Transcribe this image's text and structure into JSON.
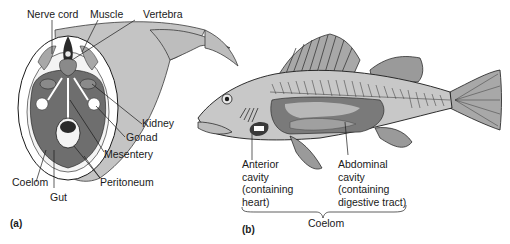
{
  "figure": {
    "panel_a": {
      "panel_label": "(a)",
      "title": "Cross-section of fish body",
      "labels": {
        "nerve_cord": "Nerve cord",
        "muscle": "Muscle",
        "vertebra": "Vertebra",
        "kidney": "Kidney",
        "gonad": "Gonad",
        "mesentery": "Mesentery",
        "peritoneum": "Peritoneum",
        "coelom": "Coelom",
        "gut": "Gut"
      }
    },
    "panel_b": {
      "panel_label": "(b)",
      "title": "Side view of fish showing body cavities",
      "anterior_cavity": [
        "Anterior",
        "cavity",
        "(containing",
        "heart)"
      ],
      "abdominal_cavity": [
        "Abdominal",
        "cavity",
        "(containing",
        "digestive tract)"
      ],
      "brace_label": "Coelom"
    },
    "colors": {
      "background": "#ffffff",
      "light_gray": "#c8c8c8",
      "mid_gray": "#a8a8a8",
      "dark_gray": "#6e6e6e",
      "darkest": "#3a3a3a",
      "outline": "#1a1a1a",
      "white_fill": "#f4f4f4"
    }
  }
}
